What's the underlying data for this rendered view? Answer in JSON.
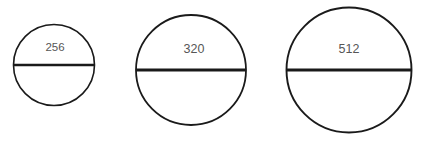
{
  "diagram": {
    "type": "circles-with-diameter-chord",
    "background_color": "#ffffff",
    "stroke_color": "#1a1a1a",
    "label_color": "#565656",
    "canvas": {
      "width": 423,
      "height": 141
    },
    "shapes": [
      {
        "name": "circle-256",
        "label": "256",
        "center_x": 54,
        "center_y": 65,
        "radius": 40.5,
        "diameter": 81,
        "outline_width": 1.6,
        "chord_y": 65,
        "chord_width": 2.4,
        "label_x": 55,
        "label_y": 51,
        "label_size": 11.5
      },
      {
        "name": "circle-320",
        "label": "320",
        "center_x": 191,
        "center_y": 70,
        "radius": 55,
        "diameter": 110,
        "outline_width": 1.8,
        "chord_y": 70,
        "chord_width": 2.8,
        "label_x": 194,
        "label_y": 53,
        "label_size": 12.5
      },
      {
        "name": "circle-512",
        "label": "512",
        "center_x": 349,
        "center_y": 70,
        "radius": 62.5,
        "diameter": 125,
        "outline_width": 1.9,
        "chord_y": 70,
        "chord_width": 3.0,
        "label_x": 349,
        "label_y": 53,
        "label_size": 12.5
      }
    ]
  }
}
